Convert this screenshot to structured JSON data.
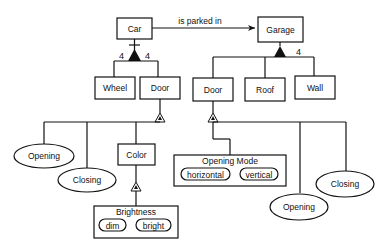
{
  "diagram": {
    "association": {
      "label": "is parked in",
      "from": "Car",
      "to": "Garage"
    },
    "car": {
      "label": "Car",
      "parts": [
        {
          "label": "Wheel",
          "multiplicity": "4"
        },
        {
          "label": "Door",
          "multiplicity": "4"
        }
      ]
    },
    "garage": {
      "label": "Garage",
      "parts": [
        {
          "label": "Door"
        },
        {
          "label": "Roof"
        },
        {
          "label": "Wall",
          "multiplicity": "4"
        }
      ]
    },
    "car_door": {
      "attributes": [
        {
          "label": "Opening"
        },
        {
          "label": "Closing"
        }
      ],
      "color": {
        "label": "Color",
        "brightness": {
          "label": "Brightness",
          "values": [
            "dim",
            "bright"
          ]
        }
      }
    },
    "garage_door": {
      "opening_mode": {
        "label": "Opening Mode",
        "values": [
          "horizontal",
          "vertical"
        ]
      },
      "attributes": [
        {
          "label": "Opening"
        },
        {
          "label": "Closing"
        }
      ]
    }
  }
}
